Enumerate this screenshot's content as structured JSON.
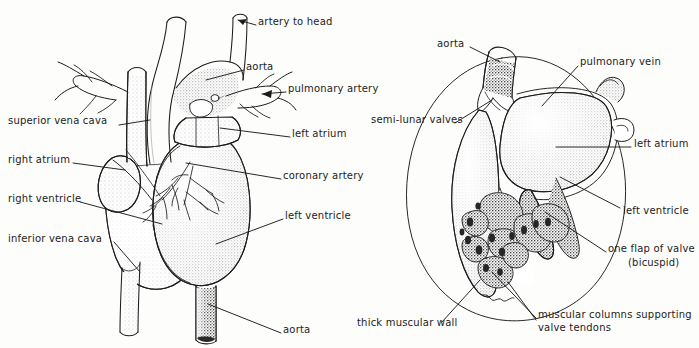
{
  "figure": {
    "background_color": "#fdfdfb",
    "ink_color": "#1c1c1c"
  },
  "diagrams": [
    {
      "id": "external-heart",
      "name": "external view of heart",
      "labels": [
        {
          "key": "artery_to_head",
          "text": "artery to head",
          "x": 258,
          "y": 22,
          "align": "left"
        },
        {
          "key": "aorta_top",
          "text": "aorta",
          "x": 246,
          "y": 67,
          "align": "left"
        },
        {
          "key": "pulmonary_artery",
          "text": "pulmonary artery",
          "x": 288,
          "y": 89,
          "align": "left"
        },
        {
          "key": "superior_vena_cava",
          "text": "superior vena cava",
          "x": 8,
          "y": 121,
          "align": "left"
        },
        {
          "key": "left_atrium",
          "text": "left atrium",
          "x": 292,
          "y": 134,
          "align": "left"
        },
        {
          "key": "right_atrium",
          "text": "right atrium",
          "x": 8,
          "y": 160,
          "align": "left"
        },
        {
          "key": "coronary_artery",
          "text": "coronary artery",
          "x": 283,
          "y": 176,
          "align": "left"
        },
        {
          "key": "right_ventricle",
          "text": "right ventricle",
          "x": 8,
          "y": 199,
          "align": "left"
        },
        {
          "key": "left_ventricle",
          "text": "left ventricle",
          "x": 285,
          "y": 216,
          "align": "left"
        },
        {
          "key": "inferior_vena_cava",
          "text": "inferior vena cava",
          "x": 8,
          "y": 239,
          "align": "left"
        },
        {
          "key": "aorta_bottom",
          "text": "aorta",
          "x": 283,
          "y": 330,
          "align": "left"
        }
      ]
    },
    {
      "id": "section-heart",
      "name": "vertical section of left side of heart",
      "labels": [
        {
          "key": "aorta",
          "text": "aorta",
          "x": 437,
          "y": 44,
          "align": "left"
        },
        {
          "key": "pulmonary_vein",
          "text": "pulmonary  vein",
          "x": 580,
          "y": 62,
          "align": "left"
        },
        {
          "key": "semi_lunar_valves",
          "text": "semi-lunar valves",
          "x": 371,
          "y": 120,
          "align": "left"
        },
        {
          "key": "left_atrium",
          "text": "left atrium",
          "x": 634,
          "y": 144,
          "align": "left"
        },
        {
          "key": "left_ventricle",
          "text": "left ventricle",
          "x": 623,
          "y": 211,
          "align": "left"
        },
        {
          "key": "one_flap_of_valve",
          "text": "one flap of valve",
          "x": 608,
          "y": 249,
          "align": "left"
        },
        {
          "key": "bicuspid",
          "text": "(bicuspid)",
          "x": 628,
          "y": 263,
          "align": "left"
        },
        {
          "key": "muscular_columns_1",
          "text": "muscular columns supporting",
          "x": 538,
          "y": 315,
          "align": "left"
        },
        {
          "key": "muscular_columns_2",
          "text": "valve tendons",
          "x": 538,
          "y": 328,
          "align": "left"
        },
        {
          "key": "thick_muscular_wall",
          "text": "thick muscular wall",
          "x": 357,
          "y": 323,
          "align": "left"
        }
      ]
    }
  ]
}
